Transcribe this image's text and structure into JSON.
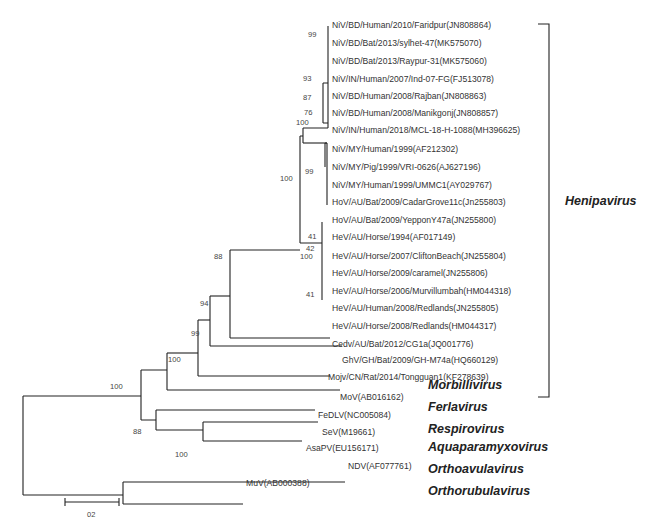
{
  "figure": {
    "type": "phylogenetic_tree",
    "scale_bar": {
      "label": "02",
      "x1": 65,
      "x2": 119,
      "y": 502
    }
  },
  "leaves": [
    {
      "label": "NiV/BD/Human/2010/Faridpur(JN808864)",
      "x": 332,
      "y": 25
    },
    {
      "label": "NiV/BD/Bat/2013/sylhet-47(MK575070)",
      "x": 332,
      "y": 45
    },
    {
      "label": "NiV/BD/Bat/2013/Raypur-31(MK575060)",
      "x": 332,
      "y": 65
    },
    {
      "label": "NiV/IN/Human/2007/Ind-07-FG(FJ513078)",
      "x": 332,
      "y": 85
    },
    {
      "label": "NiV/BD/Human/2008/Rajban(JN808863)",
      "x": 332,
      "y": 104
    },
    {
      "label": "NiV/BD/Human/2008/Manikgonj(JN808857)",
      "x": 332,
      "y": 123
    },
    {
      "label": "NiV/IN/Human/2018/MCL-18-H-1088(MH396625)",
      "x": 332,
      "y": 142
    },
    {
      "label": "NiV/MY/Human/1999(AF212302)",
      "x": 332,
      "y": 163
    },
    {
      "label": "NiV/MY/Pig/1999/VRI-0626(AJ627196)",
      "x": 332,
      "y": 183
    },
    {
      "label": "NiV/MY/Human/1999/UMMC1(AY029767)",
      "x": 332,
      "y": 203
    },
    {
      "label": "HoV/AU/Bat/2009/CadarGrove11c(Jn255803)",
      "x": 332,
      "y": 222
    },
    {
      "label": "HoV/AU/Bat/2009/YepponY47a(JN255800)",
      "x": 332,
      "y": 242
    },
    {
      "label": "HeV/AU/Horse/1994(AF017149)",
      "x": 332,
      "y": 261
    },
    {
      "label": "HeV/AU/Horse/2007/CliftonBeach(JN255804)",
      "x": 332,
      "y": 282
    },
    {
      "label": "HeV/AU/Horse/2009/caramel(JN255806)",
      "x": 332,
      "y": 301
    },
    {
      "label": "HeV/AU/Horse/2006/Murvillumbah(HM044318)",
      "x": 332,
      "y": 321
    },
    {
      "label": "HeV/AU/Human/2008/Redlands(JN255805)",
      "x": 332,
      "y": 340
    },
    {
      "label": "HeV/AU/Horse/2008/Redlands(HM044317)",
      "x": 332,
      "y": 359
    },
    {
      "label": "Cedv/AU/Bat/2012/CG1a(JQ001776)",
      "x": 332,
      "y": 379
    },
    {
      "label": "GhV/GH/Bat/2009/GH-M74a(HQ660129)",
      "x": 342,
      "y": 397
    },
    {
      "label": "Mojv/CN/Rat/2014/Tongguan1(KF278639)",
      "x": 328,
      "y": 416
    },
    {
      "label": "MoV(AB016162)",
      "x": 340,
      "y": 438
    },
    {
      "label": "FeDLV(NC005084)",
      "x": 318,
      "y": 458
    },
    {
      "label": "SeV(M19661)",
      "x": 322,
      "y": 477
    },
    {
      "label": "AsaPV(EU156171)",
      "x": 306,
      "y": 495
    },
    {
      "label": "NDV(AF077761)",
      "x": 348,
      "y": 515
    },
    {
      "label": "MuV(AB000388)",
      "x": 246,
      "y": 534
    }
  ],
  "bootstrap": [
    {
      "value": "99",
      "x": 318,
      "y": 37
    },
    {
      "value": "93",
      "x": 313,
      "y": 81
    },
    {
      "value": "87",
      "x": 313,
      "y": 100
    },
    {
      "value": "76",
      "x": 314,
      "y": 115
    },
    {
      "value": "100",
      "x": 306,
      "y": 125
    },
    {
      "value": "99",
      "x": 315,
      "y": 174
    },
    {
      "value": "100",
      "x": 290,
      "y": 181
    },
    {
      "value": "41",
      "x": 318,
      "y": 239
    },
    {
      "value": "42",
      "x": 316,
      "y": 251
    },
    {
      "value": "100",
      "x": 310,
      "y": 259
    },
    {
      "value": "41",
      "x": 316,
      "y": 297
    },
    {
      "value": "88",
      "x": 224,
      "y": 259
    },
    {
      "value": "94",
      "x": 210,
      "y": 306
    },
    {
      "value": "99",
      "x": 201,
      "y": 336
    },
    {
      "value": "100",
      "x": 178,
      "y": 362
    },
    {
      "value": "100",
      "x": 120,
      "y": 389
    },
    {
      "value": "88",
      "x": 143,
      "y": 434
    },
    {
      "value": "100",
      "x": 185,
      "y": 457
    }
  ],
  "clades": [
    {
      "genus": "Henipavirus",
      "x": 565,
      "y": 205,
      "bracket": {
        "x": 549,
        "top": 24,
        "bottom": 397
      }
    },
    {
      "genus": "Morbillivirus",
      "x": 428,
      "y": 389
    },
    {
      "genus": "Ferlavirus",
      "x": 428,
      "y": 411
    },
    {
      "genus": "Respirovirus",
      "x": 428,
      "y": 433
    },
    {
      "genus": "Aquaparamyxovirus",
      "x": 428,
      "y": 451
    },
    {
      "genus": "Orthoavulavirus",
      "x": 428,
      "y": 473
    },
    {
      "genus": "Orthorubulavirus",
      "x": 428,
      "y": 495
    }
  ]
}
